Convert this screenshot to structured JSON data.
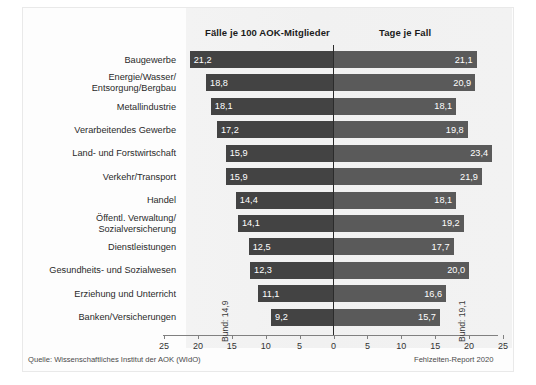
{
  "figure": {
    "left_header": "Fälle je 100 AOK-Mitglieder",
    "right_header": "Tage je Fall",
    "source": "Quelle: Wissenschaftliches Institut der AOK (WIdO)",
    "report": "Fehlzeiten-Report 2020",
    "bund_left": "Bund: 14,9",
    "bund_right": "Bund: 19,1",
    "colors": {
      "bar_left": "#434343",
      "bar_right": "#5a5a5a",
      "zero_line": "#2b2b2b",
      "plot_band": "#f1f1f1",
      "value_text": "#ffffff",
      "label_text": "#2a2a2a"
    }
  },
  "axis": {
    "ticks": [
      "25",
      "20",
      "15",
      "10",
      "5",
      "0",
      "5",
      "10",
      "15",
      "20",
      "25"
    ],
    "left_max": 25,
    "right_max": 25
  },
  "chart_data": {
    "type": "bar",
    "title": "",
    "subtitle": "",
    "orientation": "horizontal-diverging",
    "xlabel": "",
    "ylabel": "",
    "xlim": [
      -25,
      25
    ],
    "grid": false,
    "legend": "none",
    "categories": [
      "Baugewerbe",
      "Energie/Wasser/\nEntsorgung/Bergbau",
      "Metallindustrie",
      "Verarbeitendes Gewerbe",
      "Land- und Forstwirtschaft",
      "Verkehr/Transport",
      "Handel",
      "Öffentl. Verwaltung/\nSozialversicherung",
      "Dienstleistungen",
      "Gesundheits- und Sozialwesen",
      "Erziehung und Unterricht",
      "Banken/Versicherungen"
    ],
    "series": [
      {
        "name": "Fälle je 100 AOK-Mitglieder",
        "side": "left",
        "values": [
          21.2,
          18.8,
          18.1,
          17.2,
          15.9,
          15.9,
          14.4,
          14.1,
          12.5,
          12.3,
          11.1,
          9.2
        ],
        "labels": [
          "21,2",
          "18,8",
          "18,1",
          "17,2",
          "15,9",
          "15,9",
          "14,4",
          "14,1",
          "12,5",
          "12,3",
          "11,1",
          "9,2"
        ],
        "reference_value": 14.9,
        "reference_label": "Bund: 14,9"
      },
      {
        "name": "Tage je Fall",
        "side": "right",
        "values": [
          21.1,
          20.9,
          18.1,
          19.8,
          23.4,
          21.9,
          18.1,
          19.2,
          17.7,
          20.0,
          16.6,
          15.7
        ],
        "labels": [
          "21,1",
          "20,9",
          "18,1",
          "19,8",
          "23,4",
          "21,9",
          "18,1",
          "19,2",
          "17,7",
          "20,0",
          "16,6",
          "15,7"
        ],
        "reference_value": 19.1,
        "reference_label": "Bund: 19,1"
      }
    ],
    "annotations": [
      "Quelle: Wissenschaftliches Institut der AOK (WIdO)",
      "Fehlzeiten-Report 2020"
    ]
  }
}
